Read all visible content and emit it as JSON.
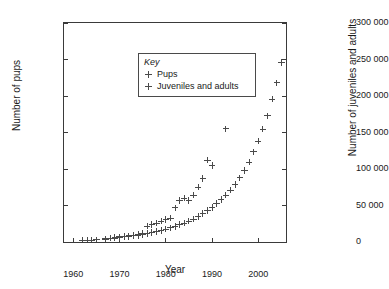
{
  "chart_data": {
    "type": "scatter",
    "title": "",
    "xlabel": "Year",
    "ylabel": "Number of pups",
    "ylabel_right": "Number of juveniles and adults",
    "xlim": [
      1958,
      2006
    ],
    "ylim": [
      0,
      30000
    ],
    "ylim_right": [
      0,
      300000
    ],
    "xticks": [
      1960,
      1970,
      1980,
      1990,
      2000
    ],
    "xticklabels": [
      "1960",
      "1970",
      "1980",
      "1990",
      "2000"
    ],
    "yticks": [
      0,
      5000,
      10000,
      15000,
      20000,
      25000,
      30000
    ],
    "yticklabels": [
      "0",
      "5000",
      "10 000",
      "15 000",
      "20 000",
      "25 000",
      "30 000"
    ],
    "yticks_right": [
      0,
      50000,
      100000,
      150000,
      200000,
      250000,
      300000
    ],
    "yticklabels_right": [
      "0",
      "50 000",
      "100 000",
      "150 000",
      "200 000",
      "250 000",
      "300 000"
    ],
    "grid": false,
    "legend_title": "Key",
    "legend_position": "upper left",
    "marker": "+",
    "marker_color": "#4a4a4a",
    "series": [
      {
        "name": "Pups",
        "axis": "left",
        "points": [
          [
            1962,
            200
          ],
          [
            1963,
            250
          ],
          [
            1964,
            280
          ],
          [
            1965,
            300
          ],
          [
            1967,
            420
          ],
          [
            1968,
            520
          ],
          [
            1969,
            560
          ],
          [
            1970,
            640
          ],
          [
            1971,
            700
          ],
          [
            1972,
            760
          ],
          [
            1973,
            840
          ],
          [
            1974,
            900
          ],
          [
            1975,
            1000
          ],
          [
            1976,
            1150
          ],
          [
            1977,
            1300
          ],
          [
            1978,
            1420
          ],
          [
            1979,
            1600
          ],
          [
            1980,
            1780
          ],
          [
            1981,
            1950
          ],
          [
            1982,
            2150
          ],
          [
            1983,
            2400
          ],
          [
            1984,
            2600
          ],
          [
            1985,
            2850
          ],
          [
            1986,
            3150
          ],
          [
            1987,
            3500
          ],
          [
            1988,
            3900
          ],
          [
            1989,
            4300
          ],
          [
            1990,
            4750
          ],
          [
            1991,
            5250
          ],
          [
            1992,
            5800
          ],
          [
            1993,
            6400
          ],
          [
            1994,
            7100
          ],
          [
            1995,
            7900
          ],
          [
            1996,
            8800
          ],
          [
            1997,
            9800
          ],
          [
            1998,
            10950
          ],
          [
            1999,
            12350
          ],
          [
            2000,
            13850
          ],
          [
            2001,
            15450
          ],
          [
            2002,
            17300
          ],
          [
            2003,
            19600
          ],
          [
            2004,
            21800
          ],
          [
            2005,
            24600
          ]
        ]
      },
      {
        "name": "Juveniles and adults",
        "axis": "right",
        "points": [
          [
            1962,
            2000
          ],
          [
            1963,
            2500
          ],
          [
            1964,
            2800
          ],
          [
            1965,
            3000
          ],
          [
            1967,
            4500
          ],
          [
            1968,
            5500
          ],
          [
            1969,
            6000
          ],
          [
            1970,
            7000
          ],
          [
            1971,
            7800
          ],
          [
            1972,
            8600
          ],
          [
            1973,
            9500
          ],
          [
            1974,
            10500
          ],
          [
            1975,
            12000
          ],
          [
            1976,
            22000
          ],
          [
            1977,
            24000
          ],
          [
            1978,
            26000
          ],
          [
            1979,
            28500
          ],
          [
            1980,
            31000
          ],
          [
            1981,
            33000
          ],
          [
            1982,
            47000
          ],
          [
            1983,
            57000
          ],
          [
            1984,
            60000
          ],
          [
            1985,
            57000
          ],
          [
            1986,
            64000
          ],
          [
            1987,
            75000
          ],
          [
            1988,
            87000
          ],
          [
            1989,
            112000
          ],
          [
            1990,
            105000
          ],
          [
            1993,
            155000
          ],
          [
            1997,
            254000
          ]
        ]
      }
    ]
  }
}
